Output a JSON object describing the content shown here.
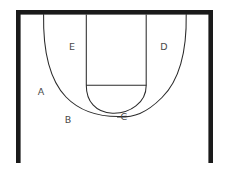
{
  "figure": {
    "background_color": "#ffffff",
    "frame_color": "#1a1a1a",
    "line_color": "#2b2b2b",
    "label_color": "#4a4a4a",
    "width": 230,
    "height": 170,
    "frame": {
      "name": "open-bottom-rectangular-frame",
      "top_bar": {
        "x": 16,
        "y": 10,
        "width": 197,
        "height": 4.5
      },
      "left_bar": {
        "x": 16,
        "y": 10,
        "width": 4.5,
        "height": 153
      },
      "right_bar": {
        "x": 208.5,
        "y": 10,
        "width": 4.5,
        "height": 153
      },
      "bottom_bar": null
    },
    "strokes": [
      {
        "name": "outer-left-arc",
        "description": "large thin curve descending from top bar at x=43 to the low tangent point",
        "start": [
          43.5,
          14.5
        ],
        "end": [
          126,
          116.5
        ]
      },
      {
        "name": "outer-right-arc",
        "description": "large thin curve descending from top bar at x=186 to the low tangent point",
        "start": [
          186,
          14.5
        ],
        "end": [
          118,
          117
        ]
      },
      {
        "name": "inner-left-vertical",
        "description": "thin vertical line from top bar down to springing line",
        "start": [
          86,
          14.5
        ],
        "end": [
          86,
          85
        ]
      },
      {
        "name": "inner-right-vertical",
        "description": "thin vertical line from top bar down to springing line",
        "start": [
          146,
          14.5
        ],
        "end": [
          146,
          85
        ]
      },
      {
        "name": "springing-horizontal-line",
        "description": "thin horizontal line joining the two inner verticals",
        "start": [
          86,
          85
        ],
        "end": [
          146,
          85
        ]
      },
      {
        "name": "inner-u-arc",
        "description": "small thin semicircular arc hanging below the springing line",
        "start": [
          86,
          85
        ],
        "end": [
          146,
          85
        ],
        "lowest_point": [
          116,
          113
        ]
      }
    ]
  },
  "labels": [
    {
      "id": "label-a",
      "text": "A",
      "x": 41,
      "y": 92
    },
    {
      "id": "label-b",
      "text": "B",
      "x": 68,
      "y": 120
    },
    {
      "id": "label-c",
      "text": "C",
      "x": 124,
      "y": 117
    },
    {
      "id": "label-d",
      "text": "D",
      "x": 164,
      "y": 47
    },
    {
      "id": "label-e",
      "text": "E",
      "x": 72,
      "y": 47
    }
  ]
}
